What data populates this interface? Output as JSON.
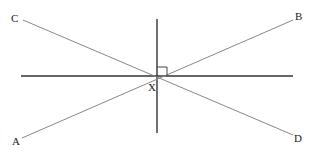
{
  "diagram": {
    "type": "geometry-intersecting-lines",
    "labels": {
      "A": "A",
      "B": "B",
      "C": "C",
      "D": "D",
      "X": "X"
    },
    "points": {
      "A": [
        22,
        138
      ],
      "B": [
        293,
        20
      ],
      "C": [
        23,
        20
      ],
      "D": [
        293,
        135
      ],
      "X": [
        157,
        76
      ]
    },
    "lines": [
      {
        "name": "AB",
        "from": "A",
        "to": "B"
      },
      {
        "name": "CD",
        "from": "C",
        "to": "D"
      },
      {
        "name": "horizontal",
        "from": [
          21,
          76
        ],
        "to": [
          293,
          76
        ]
      },
      {
        "name": "vertical",
        "from": [
          157,
          19
        ],
        "to": [
          157,
          133
        ]
      }
    ],
    "right_angle_marker": {
      "at": "X",
      "size": 9
    },
    "colors": {
      "axis_lines": "#333333",
      "diagonal_lines": "#888888",
      "text": "#222222"
    }
  }
}
